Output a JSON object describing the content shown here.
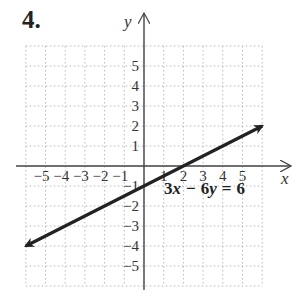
{
  "problem": {
    "number": "4."
  },
  "chart_data": {
    "type": "line",
    "title": "",
    "xlabel": "x",
    "ylabel": "y",
    "xlim": [
      -6,
      6
    ],
    "ylim": [
      -6,
      6
    ],
    "grid": true,
    "x_ticks": [
      "-5",
      "-4",
      "-3",
      "-2",
      "-1",
      "1",
      "2",
      "3",
      "4",
      "5"
    ],
    "y_ticks": [
      "5",
      "4",
      "3",
      "2",
      "1",
      "-1",
      "-2",
      "-3",
      "-4",
      "-5"
    ],
    "series": [
      {
        "name": "3x − 6y = 6",
        "equation": "3x - 6y = 6",
        "points": [
          [
            -6,
            -4
          ],
          [
            6,
            2
          ]
        ],
        "arrows": "both",
        "color": "#222222"
      }
    ],
    "annotations": [
      {
        "text": "3x − 6y = 6",
        "x": 3.5,
        "y": -1.3
      }
    ]
  },
  "labels": {
    "x_axis": "x",
    "y_axis": "y",
    "equation_parts": {
      "a": "3",
      "v1": "x",
      "op": "−",
      "b": "6",
      "v2": "y",
      "eq": "=",
      "c": "6"
    }
  }
}
